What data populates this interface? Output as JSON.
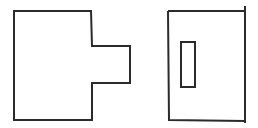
{
  "diagram": {
    "background": "#ffffff",
    "stroke_color": "#2b2b2b",
    "stroke_width": 2,
    "shapes": [
      {
        "id": "left-shape",
        "type": "polygon",
        "description": "rectangle with a rectangular tab protruding from its right side",
        "points": "14,11 91,11 92,46 130,46 130,83 92,83 92,120 14,120"
      },
      {
        "id": "right-shape",
        "type": "path",
        "description": "rectangle with right edge extending slightly beyond top and bottom",
        "d": "M168,11 L245,11 M245,6 L245,123 M168,11 L169,120 L245,121"
      },
      {
        "id": "inner-slot",
        "type": "rect",
        "description": "small vertical rectangle inside right shape",
        "x": 181,
        "y": 42,
        "width": 14,
        "height": 45
      }
    ]
  }
}
